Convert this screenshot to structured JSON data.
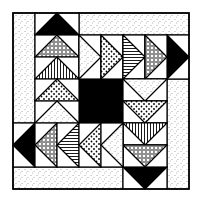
{
  "grid_units": 8,
  "colors": {
    "background": "#ffffff",
    "ink": "#000000",
    "speckle": "#555555"
  },
  "center_square": {
    "col": 3,
    "row": 3,
    "span": 2,
    "fill": "solid"
  },
  "strips": [
    {
      "name": "left-strip",
      "col": 0,
      "row": 0,
      "w": 1,
      "h": 5,
      "fill": "speckle"
    },
    {
      "name": "top-strip",
      "col": 3,
      "row": 0,
      "w": 5,
      "h": 1,
      "fill": "speckle"
    },
    {
      "name": "right-strip",
      "col": 7,
      "row": 3,
      "w": 1,
      "h": 5,
      "fill": "speckle"
    },
    {
      "name": "bottom-strip",
      "col": 0,
      "row": 7,
      "w": 5,
      "h": 1,
      "fill": "speckle"
    }
  ],
  "geese": [
    {
      "name": "goose-top-black",
      "col": 1,
      "row": 0,
      "dir": "up",
      "fill": "solid"
    },
    {
      "name": "goose-right-black",
      "col": 7,
      "row": 1,
      "dir": "right",
      "fill": "solid"
    },
    {
      "name": "goose-bottom-black",
      "col": 5,
      "row": 7,
      "dir": "down",
      "fill": "solid"
    },
    {
      "name": "goose-left-black",
      "col": 0,
      "row": 5,
      "dir": "left",
      "fill": "solid"
    },
    {
      "name": "goose-left-col-1",
      "col": 1,
      "row": 1,
      "dir": "up",
      "fill": "circles"
    },
    {
      "name": "goose-left-col-2",
      "col": 1,
      "row": 2,
      "dir": "up",
      "fill": "vstripes"
    },
    {
      "name": "goose-left-col-3",
      "col": 1,
      "row": 3,
      "dir": "up",
      "fill": "dots"
    },
    {
      "name": "goose-left-col-4",
      "col": 1,
      "row": 4,
      "dir": "up",
      "fill": "speckle"
    },
    {
      "name": "goose-top-row-1",
      "col": 3,
      "row": 1,
      "dir": "right",
      "fill": "speckle"
    },
    {
      "name": "goose-top-row-2",
      "col": 4,
      "row": 1,
      "dir": "right",
      "fill": "dots"
    },
    {
      "name": "goose-top-row-3",
      "col": 5,
      "row": 1,
      "dir": "right",
      "fill": "hstripes"
    },
    {
      "name": "goose-top-row-4",
      "col": 6,
      "row": 1,
      "dir": "right",
      "fill": "circles"
    },
    {
      "name": "goose-right-col-1",
      "col": 5,
      "row": 3,
      "dir": "down",
      "fill": "speckle"
    },
    {
      "name": "goose-right-col-2",
      "col": 5,
      "row": 4,
      "dir": "down",
      "fill": "dots"
    },
    {
      "name": "goose-right-col-3",
      "col": 5,
      "row": 5,
      "dir": "down",
      "fill": "vstripes"
    },
    {
      "name": "goose-right-col-4",
      "col": 5,
      "row": 6,
      "dir": "down",
      "fill": "circles"
    },
    {
      "name": "goose-bottom-row-1",
      "col": 1,
      "row": 5,
      "dir": "left",
      "fill": "circles"
    },
    {
      "name": "goose-bottom-row-2",
      "col": 2,
      "row": 5,
      "dir": "left",
      "fill": "hstripes"
    },
    {
      "name": "goose-bottom-row-3",
      "col": 3,
      "row": 5,
      "dir": "left",
      "fill": "dots"
    },
    {
      "name": "goose-bottom-row-4",
      "col": 4,
      "row": 5,
      "dir": "left",
      "fill": "speckle"
    }
  ]
}
